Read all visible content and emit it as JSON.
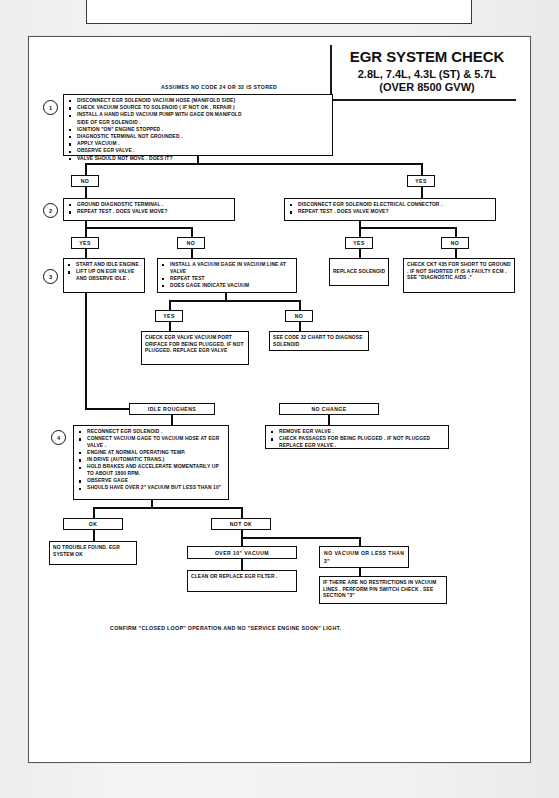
{
  "page": {
    "banner": "1988-90 LIGHT AND MEDIUM TRUCK AND VAN",
    "background_color": "#f2f1ef",
    "sheet_color": "#ffffff",
    "ink_color": "#0e0e0e"
  },
  "title_block": {
    "line1": "EGR SYSTEM CHECK",
    "line2": "2.8L, 7.4L, 4.3L (ST) & 5.7L",
    "line3": "(OVER 8500 GVW)"
  },
  "assumption": "ASSUMES NO CODE 24 OR 32 IS STORED",
  "footnote": "CONFIRM \"CLOSED LOOP\" OPERATION AND NO \"SERVICE ENGINE SOON\" LIGHT.",
  "steps": {
    "one": "1",
    "two": "2",
    "three": "3",
    "four": "4"
  },
  "nodes": {
    "step1": {
      "id": "step1-box",
      "items": [
        "DISCONNECT EGR SOLENOID VACUUM HOSE (MANIFOLD SIDE)",
        "CHECK VACUUM SOURCE TO SOLENOID ( IF NOT OK , REPAIR )",
        "INSTALL A HAND HELD VACUUM PUMP WITH GAGE ON MANIFOLD",
        "SIDE OF EGR SOLENOID .",
        "IGNITION \"ON\" ENGINE STOPPED .",
        "DIAGNOSTIC TERMINAL NOT GROUNDED .",
        "APPLY VACUUM .",
        "OBSERVE EGR VALVE .",
        "VALVE SHOULD NOT MOVE .  DOES IT?"
      ]
    },
    "step2_left": {
      "items": [
        "GROUND DIAGNOSTIC TERMINAL .",
        "REPEAT TEST .  DOES VALVE MOVE?"
      ]
    },
    "step2_right": {
      "items": [
        "DISCONNECT EGR SOLENOID ELECTRICAL CONNECTOR .",
        "REPEAT TEST .  DOES VALVE MOVE?"
      ]
    },
    "step3_left": {
      "items": [
        "START AND IDLE ENGINE .",
        "LIFT UP ON EGR VALVE  AND OBSERVE IDLE ."
      ]
    },
    "step3_mid": {
      "items": [
        "INSTALL A VACUUM GAGE IN VACUUM LINE AT VALVE",
        "REPEAT TEST",
        "DOES GAGE INDICATE VACUUM"
      ]
    },
    "replace_solenoid": {
      "text": "REPLACE SOLENOID"
    },
    "check_ckt435": {
      "text": "CHECK CKT 435 FOR SHORT TO GROUND . IF NOT SHORTED IT IS A FAULTY ECM .  SEE \"DIAGNOSTIC AIDS .\""
    },
    "check_egr_port": {
      "text": "CHECK EGR VALVE VACUUM PORT ORIFACE FOR BEING PLUGGED.  IF NOT PLUGGED. REPLACE EGR VALVE"
    },
    "see_code32": {
      "text": "SEE CODE 32 CHART TO DIAGNOSE SOLENOID"
    },
    "step4": {
      "items": [
        "RECONNECT EGR SOLENOID .",
        "CONNECT VACUUM GAGE TO VACUUM HOSE AT EGR VALVE .",
        "ENGINE AT NORMAL OPERATING TEMP.",
        "IN DRIVE (AUTOMATIC TRANS.)",
        "HOLD BRAKES AND ACCELERATE MOMENTARILY UP TO ABOUT 1800 RPM.",
        "OBSERVE GAGE",
        "SHOULD HAVE OVER 2\" VACUUM BUT LESS THAN 10\""
      ]
    },
    "no_change_box": {
      "items": [
        "REMOVE EGR VALVE .",
        "CHECK PASSAGES FOR BEING PLUGGED . IF NOT PLUGGED REPLACE EGR VALVE ."
      ]
    },
    "no_trouble": {
      "text": "NO TROUBLE FOUND. EGR SYSTEM OK"
    },
    "clean_filter": {
      "text": "CLEAN OR REPLACE EGR FILTER ."
    },
    "no_restrictions": {
      "text": "IF THERE ARE NO RESTRICTIONS IN VACUUM LINES . PERFORM P/N SWITCH CHECK .  SEE SECTION \"3\""
    }
  },
  "labels": {
    "no1": "NO",
    "yes1": "YES",
    "yes2": "YES",
    "no2": "NO",
    "yes3": "YES",
    "no3": "NO",
    "yes4": "YES",
    "no4": "NO",
    "idle_roughens": "IDLE ROUGHENS",
    "no_change": "NO CHANGE",
    "ok": "OK",
    "not_ok": "NOT OK",
    "over10": "OVER  10\" VACUUM",
    "novac": "NO VACUUM OR LESS THAN 2\""
  }
}
